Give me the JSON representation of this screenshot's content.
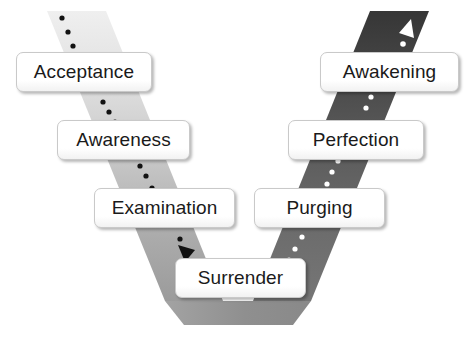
{
  "diagram": {
    "type": "process-flow",
    "orientation": "v-shape",
    "colors": {
      "descending_band_top": "#ededed",
      "descending_band_bottom": "#9d9d9d",
      "ascending_band_bottom": "#6f6f6f",
      "ascending_band_top": "#3a3a3a",
      "bottom_band": "#9a9a9a",
      "label_fill": "#ffffff",
      "label_border": "#c9c9c9",
      "label_text": "#1a1a1a",
      "dot_dark": "#111111",
      "dot_light": "#ffffff",
      "background": "#ffffff"
    },
    "descending_path": {
      "name": "descending-path",
      "direction": "downward",
      "arrow": "down-right-arrowhead",
      "arrow_color": "#111111",
      "dot_color": "#111111",
      "steps": [
        {
          "order": 1,
          "label": "Acceptance"
        },
        {
          "order": 2,
          "label": "Awareness"
        },
        {
          "order": 3,
          "label": "Examination"
        }
      ]
    },
    "pivot": {
      "name": "pivot-step",
      "label": "Surrender",
      "order": 4
    },
    "ascending_path": {
      "name": "ascending-path",
      "direction": "upward",
      "arrow": "up-right-arrowhead",
      "arrow_color": "#ffffff",
      "dot_color": "#ffffff",
      "steps": [
        {
          "order": 5,
          "label": "Purging"
        },
        {
          "order": 6,
          "label": "Perfection"
        },
        {
          "order": 7,
          "label": "Awakening"
        }
      ]
    }
  }
}
